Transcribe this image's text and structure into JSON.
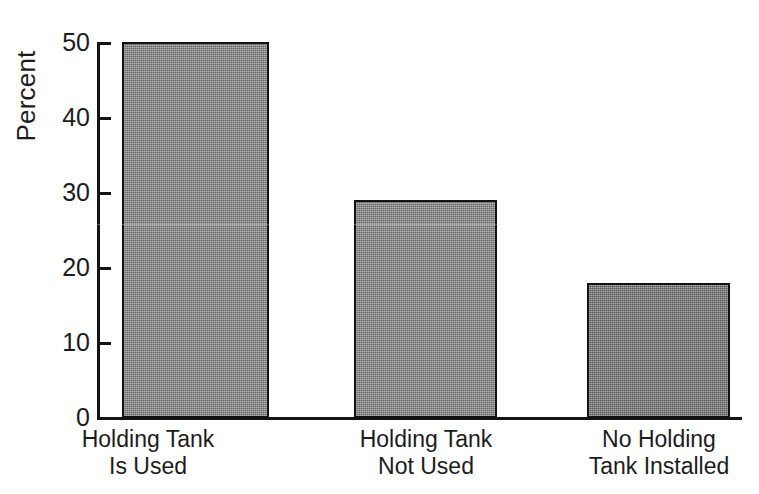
{
  "chart_data": {
    "type": "bar",
    "title": "",
    "subtitle": "",
    "xlabel": "",
    "ylabel": "Percent",
    "ylim": [
      0,
      50
    ],
    "ytick_values": [
      50,
      40,
      30,
      20,
      10,
      0
    ],
    "ytick_labels": [
      "50",
      "40",
      "30",
      "20",
      "10",
      "0"
    ],
    "grid": false,
    "legend": false,
    "legend_position": "none",
    "categories": [
      "Holding Tank Is Used",
      "Holding Tank Not Used",
      "No Holding Tank Installed"
    ],
    "category_lines": [
      [
        "Holding Tank",
        "Is Used"
      ],
      [
        "Holding Tank",
        "Not Used"
      ],
      [
        "No Holding",
        "Tank Installed"
      ]
    ],
    "values": [
      50,
      29,
      18
    ],
    "value_unit": "percent",
    "bar_colors": [
      "#8e8e8e",
      "#8e8e8e",
      "#7a7a7a"
    ],
    "bar_edge_color": "#121212",
    "axis_color": "#141414",
    "background_color": "#ffffff",
    "text_color": "#1c1c1c"
  },
  "axis": {
    "y_title": "Percent",
    "ticks": [
      {
        "label": "50",
        "value": 50
      },
      {
        "label": "40",
        "value": 40
      },
      {
        "label": "30",
        "value": 30
      },
      {
        "label": "20",
        "value": 20
      },
      {
        "label": "10",
        "value": 10
      },
      {
        "label": "0",
        "value": 0
      }
    ]
  },
  "bars": [
    {
      "label_line1": "Holding Tank",
      "label_line2": "Is Used",
      "value": 50
    },
    {
      "label_line1": "Holding Tank",
      "label_line2": "Not Used",
      "value": 29
    },
    {
      "label_line1": "No Holding",
      "label_line2": "Tank Installed",
      "value": 18
    }
  ]
}
